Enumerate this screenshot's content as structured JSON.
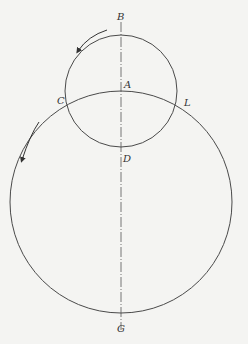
{
  "diagram": {
    "type": "two-circle geometry with rotation arrows",
    "colors": {
      "stroke": "#4a4a4a",
      "background": "#f4f4f2",
      "text": "#333333"
    },
    "axis": {
      "style": "dash-dot",
      "x": 121,
      "y1": 22,
      "y2": 330
    },
    "small_circle": {
      "cx": 121,
      "cy": 91,
      "r": 56
    },
    "large_circle": {
      "cx": 121,
      "cy": 202,
      "r": 111
    },
    "labels": {
      "B": "B",
      "A": "A",
      "C": "C",
      "L": "L",
      "D": "D",
      "G": "G"
    },
    "arrows": [
      {
        "name": "small-circle-rotation-arrow",
        "direction": "counterclockwise"
      },
      {
        "name": "large-circle-rotation-arrow",
        "direction": "counterclockwise"
      }
    ]
  }
}
